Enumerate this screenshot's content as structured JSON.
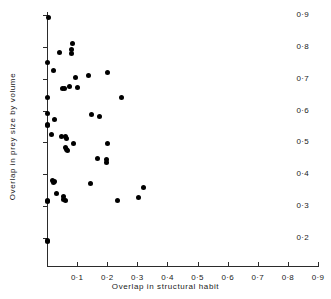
{
  "chart_data": {
    "type": "scatter",
    "title": "",
    "xlabel": "Overlap in structural habit",
    "ylabel": "Overlap in prey size by volume",
    "xlim": [
      0.0,
      0.9
    ],
    "ylim": [
      0.15,
      0.9
    ],
    "xticks": [
      0.0,
      0.1,
      0.2,
      0.3,
      0.4,
      0.5,
      0.6,
      0.7,
      0.8,
      0.9
    ],
    "yticks": [
      0.2,
      0.3,
      0.4,
      0.5,
      0.6,
      0.7,
      0.8,
      0.9
    ],
    "xticklabels": [
      "",
      "0·1",
      "0·2",
      "0·3",
      "0·4",
      "0·5",
      "0·6",
      "0·7",
      "0·8",
      "0·9"
    ],
    "yticklabels": [
      "0·2",
      "0·3",
      "0·4",
      "0·5",
      "0·6",
      "0·7",
      "0·8",
      "0·9"
    ],
    "grid": false,
    "legend": null,
    "marker": "filled-circle",
    "marker_color": "#000000",
    "axis_color": "#2b2b2b",
    "background_color": "#ffffff",
    "n_points": 49,
    "points": [
      {
        "x": 0.004,
        "y": 0.893
      },
      {
        "x": 0.002,
        "y": 0.751
      },
      {
        "x": 0.041,
        "y": 0.781
      },
      {
        "x": 0.086,
        "y": 0.81
      },
      {
        "x": 0.083,
        "y": 0.791
      },
      {
        "x": 0.082,
        "y": 0.779
      },
      {
        "x": 0.022,
        "y": 0.727
      },
      {
        "x": 0.093,
        "y": 0.704
      },
      {
        "x": 0.137,
        "y": 0.71
      },
      {
        "x": 0.2,
        "y": 0.719
      },
      {
        "x": 0.053,
        "y": 0.67
      },
      {
        "x": 0.058,
        "y": 0.668
      },
      {
        "x": 0.075,
        "y": 0.676
      },
      {
        "x": 0.102,
        "y": 0.671
      },
      {
        "x": 0.002,
        "y": 0.641
      },
      {
        "x": 0.246,
        "y": 0.641
      },
      {
        "x": 0.002,
        "y": 0.592
      },
      {
        "x": 0.024,
        "y": 0.572
      },
      {
        "x": 0.002,
        "y": 0.557
      },
      {
        "x": 0.001,
        "y": 0.552
      },
      {
        "x": 0.149,
        "y": 0.588
      },
      {
        "x": 0.173,
        "y": 0.582
      },
      {
        "x": 0.015,
        "y": 0.524
      },
      {
        "x": 0.049,
        "y": 0.519
      },
      {
        "x": 0.063,
        "y": 0.518
      },
      {
        "x": 0.066,
        "y": 0.513
      },
      {
        "x": 0.087,
        "y": 0.498
      },
      {
        "x": 0.201,
        "y": 0.497
      },
      {
        "x": 0.06,
        "y": 0.484
      },
      {
        "x": 0.066,
        "y": 0.478
      },
      {
        "x": 0.069,
        "y": 0.476
      },
      {
        "x": 0.168,
        "y": 0.451
      },
      {
        "x": 0.197,
        "y": 0.446
      },
      {
        "x": 0.197,
        "y": 0.437
      },
      {
        "x": 0.019,
        "y": 0.379
      },
      {
        "x": 0.024,
        "y": 0.377
      },
      {
        "x": 0.021,
        "y": 0.373
      },
      {
        "x": 0.143,
        "y": 0.371
      },
      {
        "x": 0.322,
        "y": 0.359
      },
      {
        "x": 0.03,
        "y": 0.339
      },
      {
        "x": 0.054,
        "y": 0.329
      },
      {
        "x": 0.305,
        "y": 0.326
      },
      {
        "x": 0.001,
        "y": 0.318
      },
      {
        "x": 0.003,
        "y": 0.316
      },
      {
        "x": 0.063,
        "y": 0.319
      },
      {
        "x": 0.233,
        "y": 0.317
      },
      {
        "x": 0.001,
        "y": 0.192
      },
      {
        "x": 0.002,
        "y": 0.188
      },
      {
        "x": 0.056,
        "y": 0.322
      }
    ]
  }
}
